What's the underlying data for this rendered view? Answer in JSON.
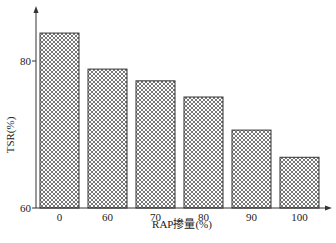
{
  "chart_data": {
    "type": "bar",
    "title": "",
    "xlabel": "RAP掺量(%)",
    "ylabel": "TSR(%)",
    "categories": [
      "0",
      "60",
      "70",
      "80",
      "90",
      "100"
    ],
    "values": [
      83.8,
      78.9,
      77.3,
      75.1,
      70.6,
      66.9
    ],
    "ylim": [
      60,
      85
    ],
    "yticks": [
      60,
      80
    ],
    "grid": false,
    "legend": null,
    "bar_fill": "crosshatch",
    "colors": {
      "bar_stroke": "#333333",
      "hatch": "#555555",
      "axis": "#333333"
    }
  }
}
